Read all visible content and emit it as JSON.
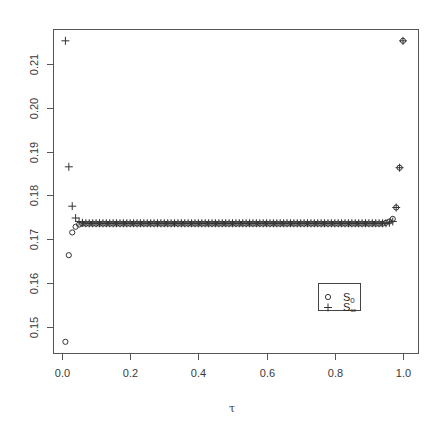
{
  "chart_data": {
    "type": "scatter",
    "title": "",
    "xlabel": "τ",
    "ylabel": "",
    "xlim": [
      -0.02,
      1.02
    ],
    "ylim": [
      0.144,
      0.218
    ],
    "xticks": [
      0.0,
      0.2,
      0.4,
      0.6,
      0.8,
      1.0
    ],
    "xtick_labels": [
      "0.0",
      "0.2",
      "0.4",
      "0.6",
      "0.8",
      "1.0"
    ],
    "yticks": [
      0.15,
      0.16,
      0.17,
      0.18,
      0.19,
      0.2,
      0.21
    ],
    "ytick_labels": [
      "0.15",
      "0.16",
      "0.17",
      "0.18",
      "0.19",
      "0.20",
      "0.21"
    ],
    "grid": false,
    "legend": {
      "position": "bottom-right",
      "entries": [
        {
          "symbol": "circle",
          "label_main": "S",
          "label_sub": "0"
        },
        {
          "symbol": "plus",
          "label_main": "S",
          "label_sub": "∞"
        }
      ]
    },
    "series": [
      {
        "name": "S0",
        "marker": "circle",
        "x": [
          0.01,
          0.02,
          0.03,
          0.04,
          0.05,
          0.06,
          0.07,
          0.08,
          0.09,
          0.1,
          0.11,
          0.12,
          0.13,
          0.14,
          0.15,
          0.16,
          0.17,
          0.18,
          0.19,
          0.2,
          0.21,
          0.22,
          0.23,
          0.24,
          0.25,
          0.26,
          0.27,
          0.28,
          0.29,
          0.3,
          0.31,
          0.32,
          0.33,
          0.34,
          0.35,
          0.36,
          0.37,
          0.38,
          0.39,
          0.4,
          0.41,
          0.42,
          0.43,
          0.44,
          0.45,
          0.46,
          0.47,
          0.48,
          0.49,
          0.5,
          0.51,
          0.52,
          0.53,
          0.54,
          0.55,
          0.56,
          0.57,
          0.58,
          0.59,
          0.6,
          0.61,
          0.62,
          0.63,
          0.64,
          0.65,
          0.66,
          0.67,
          0.68,
          0.69,
          0.7,
          0.71,
          0.72,
          0.73,
          0.74,
          0.75,
          0.76,
          0.77,
          0.78,
          0.79,
          0.8,
          0.81,
          0.82,
          0.83,
          0.84,
          0.85,
          0.86,
          0.87,
          0.88,
          0.89,
          0.9,
          0.91,
          0.92,
          0.93,
          0.94,
          0.95,
          0.96,
          0.97,
          0.98,
          0.99,
          1.0
        ],
        "y": [
          0.1465,
          0.1663,
          0.1715,
          0.1728,
          0.1733,
          0.1735,
          0.1735,
          0.1735,
          0.1735,
          0.1735,
          0.1735,
          0.1735,
          0.1735,
          0.1735,
          0.1735,
          0.1735,
          0.1735,
          0.1735,
          0.1735,
          0.1735,
          0.1735,
          0.1735,
          0.1735,
          0.1735,
          0.1735,
          0.1735,
          0.1735,
          0.1735,
          0.1735,
          0.1735,
          0.1735,
          0.1735,
          0.1735,
          0.1735,
          0.1735,
          0.1735,
          0.1735,
          0.1735,
          0.1735,
          0.1735,
          0.1735,
          0.1735,
          0.1735,
          0.1735,
          0.1735,
          0.1735,
          0.1735,
          0.1735,
          0.1735,
          0.1735,
          0.1735,
          0.1735,
          0.1735,
          0.1735,
          0.1735,
          0.1735,
          0.1735,
          0.1735,
          0.1735,
          0.1735,
          0.1735,
          0.1735,
          0.1735,
          0.1735,
          0.1735,
          0.1735,
          0.1735,
          0.1735,
          0.1735,
          0.1735,
          0.1735,
          0.1735,
          0.1735,
          0.1735,
          0.1735,
          0.1735,
          0.1735,
          0.1735,
          0.1735,
          0.1735,
          0.1735,
          0.1735,
          0.1735,
          0.1735,
          0.1735,
          0.1735,
          0.1735,
          0.1735,
          0.1735,
          0.1735,
          0.1735,
          0.1735,
          0.1735,
          0.1735,
          0.1737,
          0.174,
          0.1746,
          0.1772,
          0.1863,
          0.2153
        ]
      },
      {
        "name": "S∞",
        "marker": "plus",
        "x": [
          0.01,
          0.02,
          0.03,
          0.04,
          0.05,
          0.06,
          0.07,
          0.08,
          0.09,
          0.1,
          0.11,
          0.12,
          0.13,
          0.14,
          0.15,
          0.16,
          0.17,
          0.18,
          0.19,
          0.2,
          0.21,
          0.22,
          0.23,
          0.24,
          0.25,
          0.26,
          0.27,
          0.28,
          0.29,
          0.3,
          0.31,
          0.32,
          0.33,
          0.34,
          0.35,
          0.36,
          0.37,
          0.38,
          0.39,
          0.4,
          0.41,
          0.42,
          0.43,
          0.44,
          0.45,
          0.46,
          0.47,
          0.48,
          0.49,
          0.5,
          0.51,
          0.52,
          0.53,
          0.54,
          0.55,
          0.56,
          0.57,
          0.58,
          0.59,
          0.6,
          0.61,
          0.62,
          0.63,
          0.64,
          0.65,
          0.66,
          0.67,
          0.68,
          0.69,
          0.7,
          0.71,
          0.72,
          0.73,
          0.74,
          0.75,
          0.76,
          0.77,
          0.78,
          0.79,
          0.8,
          0.81,
          0.82,
          0.83,
          0.84,
          0.85,
          0.86,
          0.87,
          0.88,
          0.89,
          0.9,
          0.91,
          0.92,
          0.93,
          0.94,
          0.95,
          0.96,
          0.97,
          0.98,
          0.99,
          1.0
        ],
        "y": [
          0.2153,
          0.1865,
          0.1775,
          0.1748,
          0.174,
          0.1737,
          0.1736,
          0.1736,
          0.1736,
          0.1736,
          0.1736,
          0.1736,
          0.1736,
          0.1736,
          0.1736,
          0.1736,
          0.1736,
          0.1736,
          0.1736,
          0.1736,
          0.1736,
          0.1736,
          0.1736,
          0.1736,
          0.1736,
          0.1736,
          0.1736,
          0.1736,
          0.1736,
          0.1736,
          0.1736,
          0.1736,
          0.1736,
          0.1736,
          0.1736,
          0.1736,
          0.1736,
          0.1736,
          0.1736,
          0.1736,
          0.1736,
          0.1736,
          0.1736,
          0.1736,
          0.1736,
          0.1736,
          0.1736,
          0.1736,
          0.1736,
          0.1736,
          0.1736,
          0.1736,
          0.1736,
          0.1736,
          0.1736,
          0.1736,
          0.1736,
          0.1736,
          0.1736,
          0.1736,
          0.1736,
          0.1736,
          0.1736,
          0.1736,
          0.1736,
          0.1736,
          0.1736,
          0.1736,
          0.1736,
          0.1736,
          0.1736,
          0.1736,
          0.1736,
          0.1736,
          0.1736,
          0.1736,
          0.1736,
          0.1736,
          0.1736,
          0.1736,
          0.1736,
          0.1736,
          0.1736,
          0.1736,
          0.1736,
          0.1736,
          0.1736,
          0.1736,
          0.1736,
          0.1736,
          0.1736,
          0.1736,
          0.1736,
          0.1736,
          0.1736,
          0.1737,
          0.174,
          0.1772,
          0.1863,
          0.2153
        ]
      }
    ]
  },
  "colors": {
    "axis": "#555555",
    "marker": "#333333",
    "text": "#3a3a3a",
    "background": "#ffffff"
  }
}
